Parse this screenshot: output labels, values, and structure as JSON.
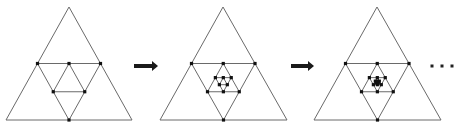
{
  "diagram": {
    "colors": {
      "edge": "#6a6a6a",
      "vertex": "#111111",
      "arrow": "#1a1a1a"
    },
    "stages": [
      {
        "apex": [
          69,
          7
        ],
        "left": [
          6,
          120
        ],
        "right": [
          132,
          120
        ],
        "depth": 2
      },
      {
        "apex": [
          223,
          7
        ],
        "left": [
          160,
          120
        ],
        "right": [
          287,
          120
        ],
        "depth": 4
      },
      {
        "apex": [
          377,
          7
        ],
        "left": [
          314,
          120
        ],
        "right": [
          441,
          120
        ],
        "depth": 6
      }
    ],
    "arrows": [
      {
        "x1": 134,
        "x2": 158,
        "y": 66
      },
      {
        "x1": 291,
        "x2": 314,
        "y": 66
      }
    ],
    "ellipsis": {
      "label": "...",
      "dots": [
        [
          432,
          66
        ],
        [
          442,
          66
        ],
        [
          452,
          66
        ]
      ]
    }
  }
}
